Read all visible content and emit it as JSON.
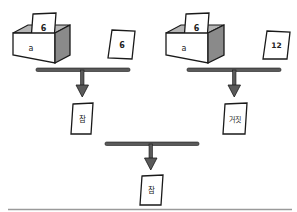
{
  "diagram": {
    "type": "logic-comparison",
    "colors": {
      "line": "#1a1a1a",
      "bar": "#5a5a5a",
      "box_shade": "#8a8a8a",
      "box_inner": "#b5b5b5",
      "rule": "#9a9a9a"
    },
    "left": {
      "box_label": "a",
      "box_card": "6",
      "compare_card": "6",
      "result": "참"
    },
    "right": {
      "box_label": "a",
      "box_card": "6",
      "compare_card": "12",
      "result": "거짓"
    },
    "final": {
      "result": "참"
    }
  }
}
